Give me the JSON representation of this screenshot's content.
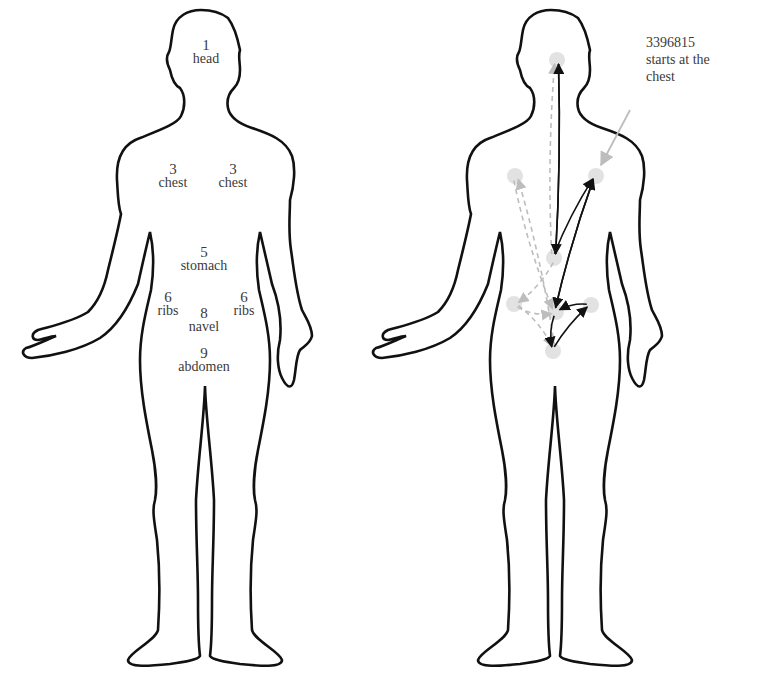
{
  "diagram": {
    "left_figure": {
      "name": "body map (front) with body-region labels",
      "regions": [
        {
          "id": "head",
          "number": "1",
          "label": "head",
          "x": 206,
          "y": 38
        },
        {
          "id": "chest-left",
          "number": "3",
          "label": "chest",
          "x": 173,
          "y": 162
        },
        {
          "id": "chest-right",
          "number": "3",
          "label": "chest",
          "x": 233,
          "y": 162
        },
        {
          "id": "stomach",
          "number": "5",
          "label": "stomach",
          "x": 204,
          "y": 245
        },
        {
          "id": "ribs-left",
          "number": "6",
          "label": "ribs",
          "x": 168,
          "y": 290
        },
        {
          "id": "navel",
          "number": "8",
          "label": "navel",
          "x": 204,
          "y": 306
        },
        {
          "id": "ribs-right",
          "number": "6",
          "label": "ribs",
          "x": 244,
          "y": 290
        },
        {
          "id": "abdomen",
          "number": "9",
          "label": "abdomen",
          "x": 204,
          "y": 346
        }
      ]
    },
    "right_figure": {
      "name": "body map with sequence arrows",
      "nodes": [
        {
          "id": "head",
          "x": 557,
          "y": 60
        },
        {
          "id": "chest-left",
          "x": 515,
          "y": 176
        },
        {
          "id": "chest-right",
          "x": 596,
          "y": 176
        },
        {
          "id": "stomach",
          "x": 554,
          "y": 258
        },
        {
          "id": "ribs-left",
          "x": 514,
          "y": 304
        },
        {
          "id": "navel",
          "x": 556,
          "y": 312
        },
        {
          "id": "ribs-right",
          "x": 591,
          "y": 305
        },
        {
          "id": "abdomen",
          "x": 553,
          "y": 351
        }
      ],
      "sequence_solid": [
        "chest-right",
        "navel",
        "ribs-right",
        "abdomen",
        "chest-right",
        "stomach",
        "head",
        "stomach"
      ],
      "solid_edges": [
        {
          "from": "head",
          "to": "stomach"
        },
        {
          "from": "stomach",
          "to": "head"
        },
        {
          "from": "stomach",
          "to": "chest-right"
        },
        {
          "from": "chest-right",
          "to": "navel"
        },
        {
          "from": "navel",
          "to": "chest-right"
        },
        {
          "from": "ribs-right",
          "to": "navel"
        },
        {
          "from": "abdomen",
          "to": "ribs-right"
        },
        {
          "from": "navel",
          "to": "abdomen"
        }
      ],
      "dashed_edges": [
        {
          "from": "stomach",
          "to": "head"
        },
        {
          "from": "abdomen",
          "to": "chest-left"
        },
        {
          "from": "stomach",
          "to": "ribs-left"
        },
        {
          "from": "ribs-left",
          "to": "navel"
        },
        {
          "from": "ribs-left",
          "to": "abdomen"
        },
        {
          "from": "chest-left",
          "to": "navel"
        }
      ],
      "annotation": {
        "lines": [
          "3396815",
          "starts at the",
          "chest"
        ],
        "arrow_from": {
          "x": 630,
          "y": 110
        },
        "arrow_to": {
          "x": 601,
          "y": 165
        }
      }
    },
    "colors": {
      "outline": "#111111",
      "solid_arrow": "#111111",
      "dashed_arrow": "#bdbdbd",
      "node_fill": "#e2e2e2",
      "annotation_arrow": "#bdbdbd",
      "label_text": "#3a3a3a"
    }
  }
}
